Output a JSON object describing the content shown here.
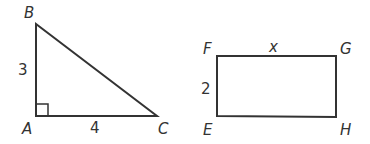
{
  "triangle": {
    "vertices": {
      "A": "A",
      "B": "B",
      "C": "C"
    },
    "side_AB": "3",
    "side_AC": "4",
    "right_angle_at": "A"
  },
  "rectangle": {
    "vertices": {
      "E": "E",
      "F": "F",
      "G": "G",
      "H": "H"
    },
    "side_FE": "2",
    "side_FG": "x"
  },
  "colors": {
    "stroke": "#333333",
    "background": "#ffffff"
  }
}
